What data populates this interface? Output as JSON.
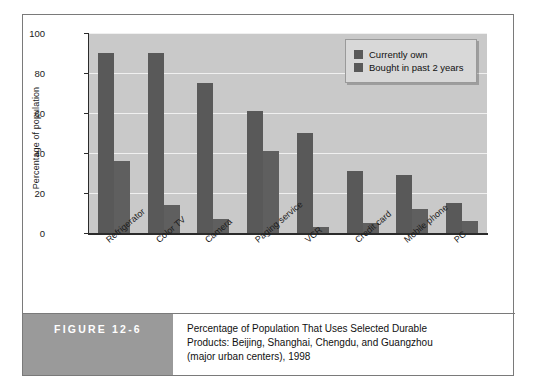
{
  "figure": {
    "label": "FIGURE 12-6",
    "caption_lines": [
      "Percentage of Population That Uses Selected Durable",
      "Products: Beijing, Shanghai, Chengdu, and Guangzhou",
      "(major urban centers), 1998"
    ]
  },
  "colors": {
    "plot_background": "#c9c9c9",
    "gridline": "#f0f0f0",
    "series_own": "#595959",
    "series_bought": "#5f5f5f",
    "axis": "#2b2b2b",
    "figure_label_block": "#9a9a9a"
  },
  "chart_data": {
    "type": "bar",
    "title": "",
    "xlabel": "",
    "ylabel": "Percentage of population",
    "ylim": [
      0,
      100
    ],
    "yticks": [
      0,
      20,
      40,
      60,
      80,
      100
    ],
    "grid": true,
    "legend_position": "top-right",
    "categories": [
      "Refrigerator",
      "Color TV",
      "Camera",
      "Paging service",
      "VCR",
      "Credit card",
      "Mobile phone",
      "PC"
    ],
    "series": [
      {
        "name": "Currently own",
        "values": [
          90,
          90,
          75,
          61,
          50,
          31,
          29,
          15
        ]
      },
      {
        "name": "Bought in past 2 years",
        "values": [
          36,
          14,
          7,
          41,
          3,
          5,
          12,
          6
        ]
      }
    ]
  }
}
